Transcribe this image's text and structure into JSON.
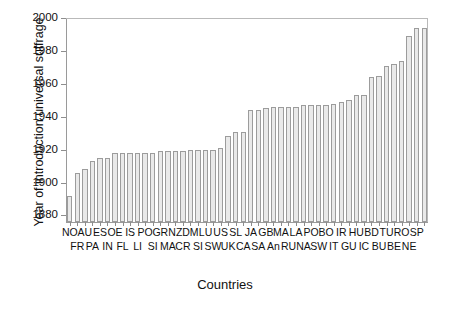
{
  "chart_data": {
    "type": "bar",
    "title": "",
    "xlabel": "Countries",
    "ylabel": "Year of introduction universal suffrage",
    "ylim": [
      1876,
      2000
    ],
    "ytick_values": [
      1880,
      1900,
      1920,
      1940,
      1960,
      1980,
      2000
    ],
    "ytick_labels": [
      "1880",
      "1900",
      "1920",
      "1940",
      "1960",
      "1980",
      "2000"
    ],
    "grid": false,
    "legend": "none",
    "bar_fill_color": "#e9e9e9",
    "bar_edge_color": "#9c9c9c",
    "bar_pattern": "stippled-dots",
    "categories": [
      "NZ",
      "FR",
      "NO",
      "PA",
      "AU",
      "IN",
      "ES",
      "FL",
      "OE",
      "LI",
      "IS",
      "SI",
      "PO",
      "MA",
      "GR",
      "CR",
      "NZ",
      "SI",
      "DM",
      "SW",
      "LU",
      "UK",
      "US",
      "CA",
      "SL",
      "SA",
      "JA",
      "An",
      "GB",
      "RU",
      "MA",
      "NA",
      "LA",
      "SW",
      "PO",
      "IT",
      "BO",
      "GU",
      "IR",
      "IC",
      "HU",
      "BU",
      "BD",
      "BE",
      "TU",
      "NE",
      "RO",
      "SP"
    ],
    "xlabels_row0": [
      "NO",
      "AU",
      "ES",
      "OE",
      "IS",
      "PO",
      "GR",
      "NZ",
      "DM",
      "LU",
      "US",
      "SL",
      "JA",
      "GB",
      "MA",
      "LA",
      "PO",
      "BO",
      "IR",
      "HU",
      "BD",
      "TU",
      "RO",
      "SP"
    ],
    "xlabels_row1": [
      "FR",
      "PA",
      "IN",
      "FL",
      "LI",
      "SI",
      "MA",
      "CR",
      "SI",
      "SW",
      "UK",
      "CA",
      "SA",
      "An",
      "RU",
      "NA",
      "SW",
      "IT",
      "GU",
      "IC",
      "BU",
      "BE",
      "NE"
    ],
    "values": [
      1892,
      1906,
      1908,
      1913,
      1915,
      1915,
      1918,
      1918,
      1918,
      1918,
      1918,
      1918,
      1919,
      1919,
      1919,
      1919,
      1920,
      1920,
      1920,
      1920,
      1921,
      1928,
      1931,
      1931,
      1944,
      1944,
      1945,
      1946,
      1946,
      1946,
      1946,
      1947,
      1947,
      1947,
      1947,
      1948,
      1949,
      1950,
      1953,
      1953,
      1964,
      1965,
      1971,
      1972,
      1974,
      1989,
      1994,
      1994
    ]
  }
}
